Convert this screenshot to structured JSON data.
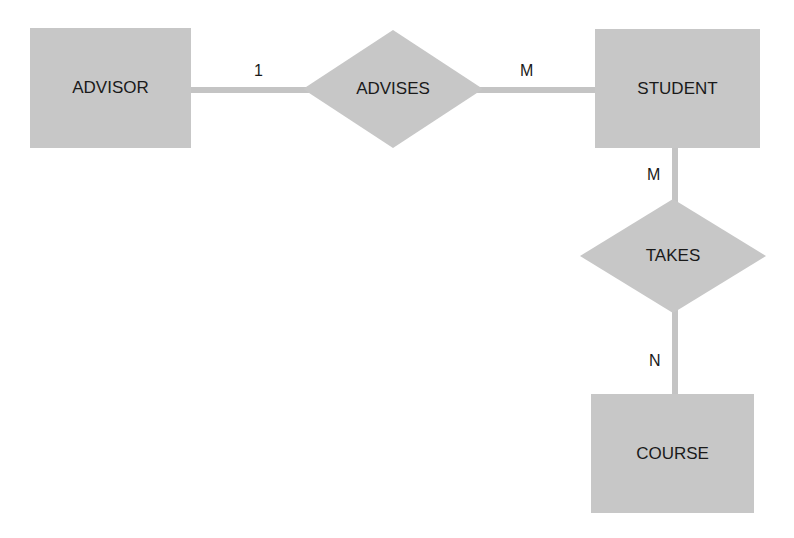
{
  "diagram": {
    "type": "entity-relationship",
    "entities": [
      {
        "id": "advisor",
        "label": "ADVISOR"
      },
      {
        "id": "student",
        "label": "STUDENT"
      },
      {
        "id": "course",
        "label": "COURSE"
      }
    ],
    "relationships": [
      {
        "id": "advises",
        "label": "ADVISES",
        "from": "advisor",
        "to": "student",
        "from_cardinality": "1",
        "to_cardinality": "M"
      },
      {
        "id": "takes",
        "label": "TAKES",
        "from": "student",
        "to": "course",
        "from_cardinality": "M",
        "to_cardinality": "N"
      }
    ],
    "colors": {
      "shape_fill": "#c7c7c7",
      "line": "#c4c4c4",
      "text": "#1a1a1a"
    }
  }
}
